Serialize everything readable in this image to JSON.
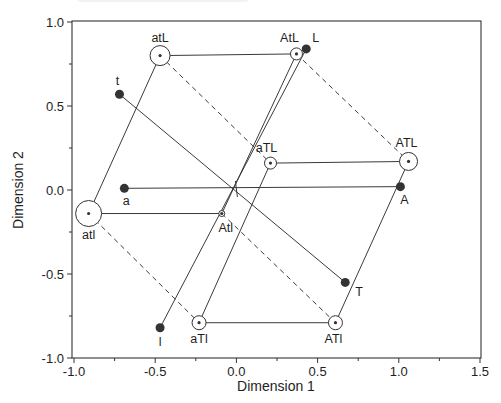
{
  "chart_data": {
    "type": "scatter",
    "title": "",
    "xlabel": "Dimension 1",
    "ylabel": "Dimension 2",
    "xlim": [
      -1.0,
      1.5
    ],
    "ylim": [
      -1.0,
      1.0
    ],
    "xticks": [
      "-1.0",
      "-0.5",
      "0.0",
      "0.5",
      "1.0",
      "1.5"
    ],
    "yticks": [
      "1.0",
      "0.5",
      "0.0",
      "-0.5",
      "-1.0"
    ],
    "grid": false,
    "legend": null,
    "series": [
      {
        "name": "single-factor points (filled)",
        "marker": "filled-circle",
        "points": [
          {
            "label": "t",
            "x": -0.72,
            "y": 0.57
          },
          {
            "label": "L",
            "x": 0.43,
            "y": 0.84
          },
          {
            "label": "a",
            "x": -0.69,
            "y": 0.01
          },
          {
            "label": "A",
            "x": 1.01,
            "y": 0.02
          },
          {
            "label": "T",
            "x": 0.67,
            "y": -0.55
          },
          {
            "label": "l",
            "x": -0.47,
            "y": -0.82
          }
        ]
      },
      {
        "name": "combination points (circled)",
        "marker": "open-circle-with-dot",
        "points": [
          {
            "label": "atL",
            "x": -0.47,
            "y": 0.8,
            "r": 10
          },
          {
            "label": "AtL",
            "x": 0.37,
            "y": 0.81,
            "r": 6
          },
          {
            "label": "aTL",
            "x": 0.21,
            "y": 0.16,
            "r": 6
          },
          {
            "label": "ATL",
            "x": 1.06,
            "y": 0.17,
            "r": 9
          },
          {
            "label": "atl",
            "x": -0.91,
            "y": -0.14,
            "r": 13
          },
          {
            "label": "Atl",
            "x": -0.09,
            "y": -0.14,
            "r": 3
          },
          {
            "label": "aTl",
            "x": -0.23,
            "y": -0.79,
            "r": 7
          },
          {
            "label": "ATl",
            "x": 0.61,
            "y": -0.79,
            "r": 7
          }
        ]
      }
    ],
    "segments_solid": [
      [
        "a",
        "A"
      ],
      [
        "t",
        "T"
      ],
      [
        "l",
        "L"
      ],
      [
        "atL",
        "AtL"
      ],
      [
        "aTL",
        "ATL"
      ],
      [
        "atl",
        "Atl"
      ],
      [
        "aTl",
        "ATl"
      ],
      [
        "atl",
        "atL"
      ],
      [
        "Atl",
        "AtL"
      ],
      [
        "aTl",
        "aTL"
      ],
      [
        "ATl",
        "ATL"
      ]
    ],
    "segments_dashed": [
      [
        "atL",
        "aTL"
      ],
      [
        "AtL",
        "ATL"
      ],
      [
        "atl",
        "aTl"
      ],
      [
        "Atl",
        "ATl"
      ]
    ],
    "center_marker": {
      "x": 0.0,
      "y": 0.0
    }
  },
  "labels": {
    "xlabel": "Dimension 1",
    "ylabel": "Dimension 2"
  }
}
